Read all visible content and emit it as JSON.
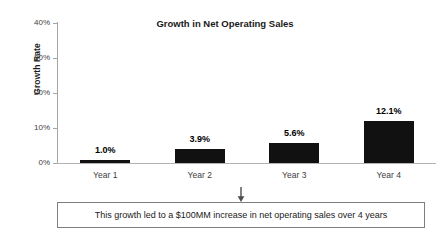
{
  "chart_data": {
    "type": "bar",
    "title": "Growth in Net Operating Sales",
    "xlabel": "",
    "ylabel": "Growth Rate",
    "categories": [
      "Year 1",
      "Year 2",
      "Year 3",
      "Year 4"
    ],
    "values": [
      1.0,
      3.9,
      5.6,
      12.1
    ],
    "data_labels": [
      "1.0%",
      "3.9%",
      "5.6%",
      "12.1%"
    ],
    "ylim": [
      0,
      40
    ],
    "ytick_values": [
      0,
      10,
      20,
      30,
      40
    ],
    "ytick_labels": [
      "0%",
      "10%",
      "20%",
      "30%",
      "40%"
    ],
    "grid": false,
    "legend": null,
    "bar_color": "#111111",
    "annotation": "This growth led to a $100MM increase in net operating sales over 4 years"
  },
  "callout": {
    "text": "This growth led to a $100MM increase in net operating sales over 4 years"
  }
}
